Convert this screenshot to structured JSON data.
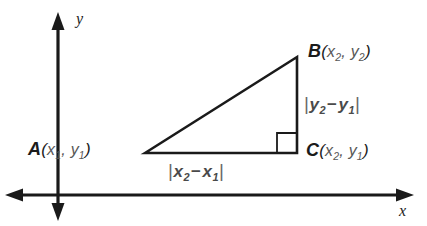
{
  "figure": {
    "background_color": "#ffffff",
    "stroke_color": "#1a1a1a"
  },
  "axes": {
    "x_label": "x",
    "y_label": "y",
    "origin_px": {
      "x": 58,
      "y": 195
    }
  },
  "triangle": {
    "vertices": [
      {
        "name": "A",
        "coord_label": "A(x1, y1)",
        "letter": "A",
        "sub1": "1",
        "sub2": "1",
        "px": {
          "x": 145,
          "y": 153
        }
      },
      {
        "name": "B",
        "coord_label": "B(x2, y2)",
        "letter": "B",
        "sub1": "2",
        "sub2": "2",
        "px": {
          "x": 297,
          "y": 57
        }
      },
      {
        "name": "C",
        "coord_label": "C(x2, y1)",
        "letter": "C",
        "sub1": "2",
        "sub2": "1",
        "px": {
          "x": 297,
          "y": 153
        }
      }
    ],
    "right_angle_at": "C"
  },
  "labels": {
    "point_a": {
      "vertex": "A",
      "open": "(",
      "var1": "x",
      "sub1": "1",
      "comma": ", ",
      "var2": "y",
      "sub2": "1",
      "close": ")"
    },
    "point_b": {
      "vertex": "B",
      "open": "(",
      "var1": "x",
      "sub1": "2",
      "comma": ", ",
      "var2": "y",
      "sub2": "2",
      "close": ")"
    },
    "point_c": {
      "vertex": "C",
      "open": "(",
      "var1": "x",
      "sub1": "2",
      "comma": ", ",
      "var2": "y",
      "sub2": "1",
      "close": ")"
    },
    "horizontal_leg": {
      "bar_open": "|",
      "var1": "x",
      "sub1": "2",
      "minus": "−",
      "var2": "x",
      "sub2": "1",
      "bar_close": "|"
    },
    "vertical_leg": {
      "bar_open": "|",
      "var1": "y",
      "sub1": "2",
      "minus": "−",
      "var2": "y",
      "sub2": "1",
      "bar_close": "|"
    }
  }
}
